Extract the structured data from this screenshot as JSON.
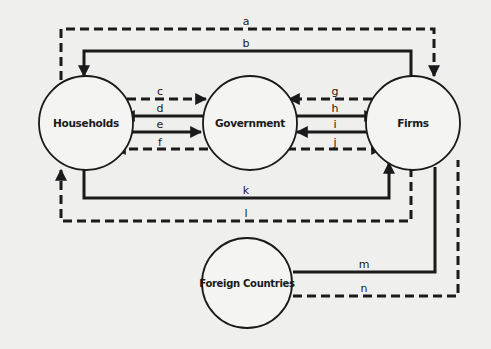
{
  "nodes": {
    "households": {
      "label": "Households"
    },
    "government": {
      "label": "Government"
    },
    "firms": {
      "label": "Firms"
    },
    "foreign": {
      "label": "Foreign Countries"
    }
  },
  "flows": {
    "a": {
      "label": "a",
      "style": "dashed",
      "from": "Households",
      "to": "Firms"
    },
    "b": {
      "label": "b",
      "style": "solid",
      "from": "Firms",
      "to": "Households"
    },
    "c": {
      "label": "c",
      "style": "dashed",
      "from": "Households",
      "to": "Government"
    },
    "d": {
      "label": "d",
      "style": "solid",
      "from": "Government",
      "to": "Households"
    },
    "e": {
      "label": "e",
      "style": "solid",
      "from": "Households",
      "to": "Government"
    },
    "f": {
      "label": "f",
      "style": "dashed",
      "from": "Government",
      "to": "Households"
    },
    "g": {
      "label": "g",
      "style": "dashed",
      "from": "Firms",
      "to": "Government"
    },
    "h": {
      "label": "h",
      "style": "solid",
      "from": "Government",
      "to": "Firms"
    },
    "i": {
      "label": "i",
      "style": "solid",
      "from": "Firms",
      "to": "Government"
    },
    "j": {
      "label": "j",
      "style": "dashed",
      "from": "Government",
      "to": "Firms"
    },
    "k": {
      "label": "k",
      "style": "solid",
      "from": "Households",
      "to": "Firms"
    },
    "l": {
      "label": "l",
      "style": "dashed",
      "from": "Firms",
      "to": "Households"
    },
    "m": {
      "label": "m",
      "style": "solid",
      "from": "Foreign Countries",
      "to": "Firms"
    },
    "n": {
      "label": "n",
      "style": "dashed",
      "from": "Foreign Countries",
      "to": "Firms"
    }
  },
  "colors": {
    "ink": "#1a1a1a",
    "background": "#efefed"
  }
}
